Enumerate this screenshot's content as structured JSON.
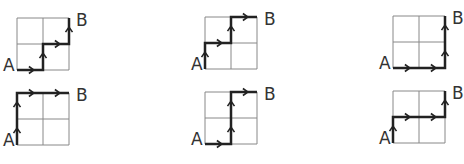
{
  "figure": {
    "grid_size": [
      2,
      2
    ],
    "colors": {
      "grid": "#888888",
      "path": "#222222",
      "label": "#333333"
    },
    "start_label": "A",
    "end_label": "B",
    "panels": [
      {
        "id": 1,
        "origin": [
          17,
          70
        ],
        "cell": 26,
        "moves": [
          "R",
          "U",
          "R",
          "U"
        ],
        "start_label": "A",
        "end_label": "B"
      },
      {
        "id": 2,
        "origin": [
          205,
          69
        ],
        "cell": 26,
        "moves": [
          "U",
          "R",
          "U",
          "R"
        ],
        "start_label": "A",
        "end_label": "B"
      },
      {
        "id": 3,
        "origin": [
          393,
          68
        ],
        "cell": 26,
        "moves": [
          "R",
          "R",
          "U",
          "U"
        ],
        "start_label": "A",
        "end_label": "B"
      },
      {
        "id": 4,
        "origin": [
          17,
          145
        ],
        "cell": 26,
        "moves": [
          "U",
          "U",
          "R",
          "R"
        ],
        "start_label": "A",
        "end_label": "B"
      },
      {
        "id": 5,
        "origin": [
          205,
          144
        ],
        "cell": 26,
        "moves": [
          "R",
          "U",
          "U",
          "R"
        ],
        "start_label": "A",
        "end_label": "B"
      },
      {
        "id": 6,
        "origin": [
          393,
          143
        ],
        "cell": 26,
        "moves": [
          "U",
          "R",
          "R",
          "U"
        ],
        "start_label": "A",
        "end_label": "B"
      }
    ]
  }
}
